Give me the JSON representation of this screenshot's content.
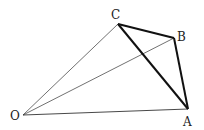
{
  "diagram": {
    "type": "geometry-figure",
    "points": {
      "O": {
        "label": "O",
        "x": 23,
        "y": 115
      },
      "A": {
        "label": "A",
        "x": 188,
        "y": 109
      },
      "B": {
        "label": "B",
        "x": 174,
        "y": 38
      },
      "C": {
        "label": "C",
        "x": 118,
        "y": 24
      }
    },
    "thin_segments": [
      "OC",
      "OB",
      "OA"
    ],
    "thick_segments": [
      "CB",
      "BA",
      "AC"
    ],
    "colors": {
      "line": "#222222",
      "background": "#ffffff"
    }
  }
}
